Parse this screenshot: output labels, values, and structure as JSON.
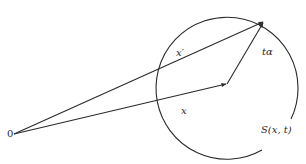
{
  "diagram": {
    "type": "vector-geometry",
    "colors": {
      "stroke": "#2a2a2a",
      "background": "#ffffff"
    },
    "origin": {
      "label": "0",
      "x": 14,
      "y": 134
    },
    "circle": {
      "label": "S(x, t)",
      "cx": 228,
      "cy": 84,
      "r": 71
    },
    "vectors": [
      {
        "id": "x",
        "label": "x",
        "from": [
          14,
          134
        ],
        "to": [
          226,
          84
        ]
      },
      {
        "id": "x_prime",
        "label": "x′",
        "from": [
          14,
          134
        ],
        "to": [
          264,
          21
        ]
      },
      {
        "id": "t_alpha",
        "label": "tα",
        "from": [
          227,
          84
        ],
        "to": [
          264,
          21
        ]
      }
    ],
    "labels": {
      "origin": "0",
      "x": "x",
      "x_prime": "x′",
      "t_alpha": "tα",
      "sphere": "S(x, t)"
    }
  }
}
